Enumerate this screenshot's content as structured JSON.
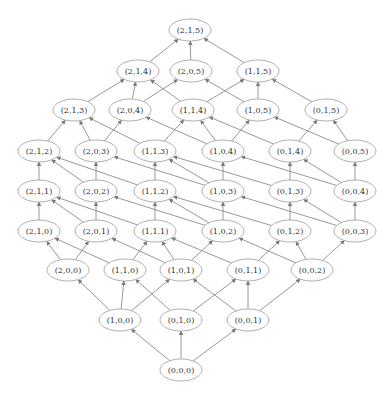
{
  "diagram": {
    "type": "lattice-graph",
    "edge_color": "#8c8c8c",
    "node_border_color": "#b0b0b0",
    "node_fill": "#ffffff",
    "text_color": "#333333",
    "nodes": [
      {
        "id": "215",
        "label": "(2,1,5)",
        "x": 190,
        "y": 30
      },
      {
        "id": "214",
        "label": "(2,1,4)",
        "x": 138,
        "y": 71
      },
      {
        "id": "205",
        "label": "(2,0,5)",
        "x": 191,
        "y": 71
      },
      {
        "id": "115",
        "label": "(1,1,5)",
        "x": 258,
        "y": 71
      },
      {
        "id": "213",
        "label": "(2,1,3)",
        "x": 74,
        "y": 110
      },
      {
        "id": "204",
        "label": "(2,0,4)",
        "x": 130,
        "y": 110
      },
      {
        "id": "114",
        "label": "(1,1,4)",
        "x": 193,
        "y": 110
      },
      {
        "id": "105",
        "label": "(1,0,5)",
        "x": 258,
        "y": 110
      },
      {
        "id": "015",
        "label": "(0,1,5)",
        "x": 326,
        "y": 110
      },
      {
        "id": "212",
        "label": "(2,1,2)",
        "x": 39,
        "y": 151
      },
      {
        "id": "203",
        "label": "(2,0,3)",
        "x": 96,
        "y": 151
      },
      {
        "id": "113",
        "label": "(1,1,3)",
        "x": 155,
        "y": 151
      },
      {
        "id": "104",
        "label": "(1,0,4)",
        "x": 223,
        "y": 151
      },
      {
        "id": "014",
        "label": "(0,1,4)",
        "x": 290,
        "y": 151
      },
      {
        "id": "005",
        "label": "(0,0,5)",
        "x": 355,
        "y": 151
      },
      {
        "id": "211",
        "label": "(2,1,1)",
        "x": 39,
        "y": 191
      },
      {
        "id": "202",
        "label": "(2,0,2)",
        "x": 96,
        "y": 191
      },
      {
        "id": "112",
        "label": "(1,1,2)",
        "x": 155,
        "y": 191
      },
      {
        "id": "103",
        "label": "(1,0,3)",
        "x": 223,
        "y": 191
      },
      {
        "id": "013",
        "label": "(0,1,3)",
        "x": 290,
        "y": 191
      },
      {
        "id": "004",
        "label": "(0,0,4)",
        "x": 355,
        "y": 191
      },
      {
        "id": "210",
        "label": "(2,1,0)",
        "x": 39,
        "y": 231
      },
      {
        "id": "201",
        "label": "(2,0,1)",
        "x": 96,
        "y": 231
      },
      {
        "id": "111",
        "label": "(1,1,1)",
        "x": 155,
        "y": 231
      },
      {
        "id": "102",
        "label": "(1,0,2)",
        "x": 223,
        "y": 231
      },
      {
        "id": "012",
        "label": "(0,1,2)",
        "x": 290,
        "y": 231
      },
      {
        "id": "003",
        "label": "(0,0,3)",
        "x": 355,
        "y": 231
      },
      {
        "id": "200",
        "label": "(2,0,0)",
        "x": 68,
        "y": 270
      },
      {
        "id": "110",
        "label": "(1,1,0)",
        "x": 125,
        "y": 270
      },
      {
        "id": "101",
        "label": "(1,0,1)",
        "x": 181,
        "y": 270
      },
      {
        "id": "011",
        "label": "(0,1,1)",
        "x": 248,
        "y": 270
      },
      {
        "id": "002",
        "label": "(0,0,2)",
        "x": 312,
        "y": 270
      },
      {
        "id": "100",
        "label": "(1,0,0)",
        "x": 120,
        "y": 320
      },
      {
        "id": "010",
        "label": "(0,1,0)",
        "x": 181,
        "y": 320
      },
      {
        "id": "001",
        "label": "(0,0,1)",
        "x": 248,
        "y": 320
      },
      {
        "id": "000",
        "label": "(0,0,0)",
        "x": 181,
        "y": 370
      }
    ]
  }
}
